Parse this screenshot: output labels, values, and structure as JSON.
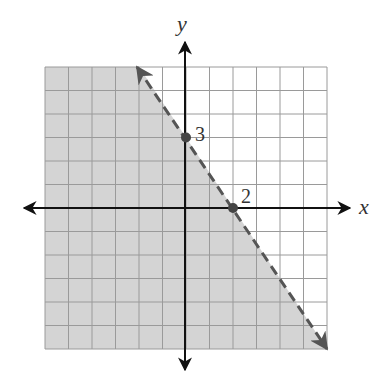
{
  "chart_data": {
    "type": "line",
    "title": "",
    "xlabel": "x",
    "ylabel": "y",
    "xlim": [
      -6,
      6
    ],
    "ylim": [
      -6,
      6
    ],
    "grid": true,
    "grid_step": 1,
    "boundary_line": {
      "equation": "y = -3/2 x + 3",
      "style": "dashed",
      "arrows": "both",
      "points": [
        [
          -2,
          6
        ],
        [
          6,
          -6
        ]
      ]
    },
    "shaded_region": "below-left of boundary (y < -3/2 x + 3)",
    "marked_points": [
      {
        "x": 0,
        "y": 3,
        "label": "3"
      },
      {
        "x": 2,
        "y": 0,
        "label": "2"
      }
    ],
    "colors": {
      "shade": "#d4d4d4",
      "grid": "#9a9a9a",
      "axis": "#111111",
      "boundary": "#555555"
    }
  },
  "labels": {
    "x_axis": "x",
    "y_axis": "y",
    "point_y_intercept": "3",
    "point_x_intercept": "2"
  }
}
